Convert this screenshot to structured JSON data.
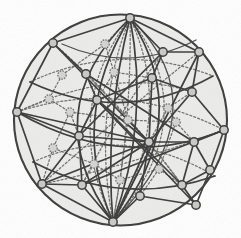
{
  "figure": {
    "background_color": "#ffffff",
    "sphere_fill_color": "#ececea",
    "sphere_outline_color": "#3b3b3b",
    "front_edge_color": "#3a3a3a",
    "back_edge_color": "#6e6e6e",
    "node_fill_color": "#c9c9c6",
    "node_stroke_color": "#383838",
    "node_radius": 4.2,
    "sphere": {
      "cx": 120.5,
      "cy": 120,
      "rx": 107,
      "ry": 106
    },
    "counts": {
      "nodes": 32,
      "front_edges": 46,
      "back_edges": 34
    }
  },
  "chart_data": {
    "type": "scatter",
    "xlabel": "",
    "ylabel": "",
    "xlim": [
      0,
      241
    ],
    "ylim": [
      0,
      238
    ],
    "grid": false,
    "legend": "none",
    "nodes": [
      {
        "id": 0,
        "x": 130,
        "y": 18,
        "layer": "front",
        "label": "top-pole"
      },
      {
        "id": 1,
        "x": 53,
        "y": 43,
        "layer": "front",
        "label": "upper-left"
      },
      {
        "id": 2,
        "x": 105,
        "y": 44,
        "layer": "back",
        "label": "upper-mid-back"
      },
      {
        "id": 3,
        "x": 163,
        "y": 52,
        "layer": "front",
        "label": "upper-right"
      },
      {
        "id": 4,
        "x": 199,
        "y": 52,
        "layer": "front",
        "label": "upper-far-right"
      },
      {
        "id": 5,
        "x": 62,
        "y": 75,
        "layer": "back",
        "label": "left-upper-back"
      },
      {
        "id": 6,
        "x": 86,
        "y": 74,
        "layer": "front",
        "label": "left-upper"
      },
      {
        "id": 7,
        "x": 152,
        "y": 78,
        "layer": "front",
        "label": "mid-upper-right"
      },
      {
        "id": 8,
        "x": 192,
        "y": 92,
        "layer": "front",
        "label": "right-upper"
      },
      {
        "id": 9,
        "x": 49,
        "y": 99,
        "layer": "back",
        "label": "left-back"
      },
      {
        "id": 10,
        "x": 97,
        "y": 100,
        "layer": "front",
        "label": "center-upper-left"
      },
      {
        "id": 11,
        "x": 17,
        "y": 112,
        "layer": "front",
        "label": "left-pole"
      },
      {
        "id": 12,
        "x": 168,
        "y": 108,
        "layer": "back",
        "label": "right-mid-back"
      },
      {
        "id": 13,
        "x": 79,
        "y": 136,
        "layer": "front",
        "label": "center-left"
      },
      {
        "id": 14,
        "x": 149,
        "y": 142,
        "layer": "front",
        "label": "center-hub"
      },
      {
        "id": 15,
        "x": 224,
        "y": 130,
        "layer": "front",
        "label": "right-pole"
      },
      {
        "id": 16,
        "x": 53,
        "y": 148,
        "layer": "back",
        "label": "lower-left-back"
      },
      {
        "id": 17,
        "x": 194,
        "y": 142,
        "layer": "front",
        "label": "right-lower"
      },
      {
        "id": 18,
        "x": 94,
        "y": 164,
        "layer": "back",
        "label": "lower-mid-back"
      },
      {
        "id": 19,
        "x": 159,
        "y": 169,
        "layer": "back",
        "label": "lower-right-back"
      },
      {
        "id": 20,
        "x": 42,
        "y": 184,
        "layer": "front",
        "label": "lower-left"
      },
      {
        "id": 21,
        "x": 82,
        "y": 185,
        "layer": "front",
        "label": "lower-left-mid"
      },
      {
        "id": 22,
        "x": 140,
        "y": 196,
        "layer": "front",
        "label": "lower-mid"
      },
      {
        "id": 23,
        "x": 182,
        "y": 185,
        "layer": "front",
        "label": "lower-right"
      },
      {
        "id": 24,
        "x": 113,
        "y": 222,
        "layer": "front",
        "label": "bottom-pole"
      },
      {
        "id": 25,
        "x": 196,
        "y": 205,
        "layer": "front",
        "label": "lower-far-right"
      },
      {
        "id": 26,
        "x": 128,
        "y": 120,
        "layer": "back",
        "label": "inner-center-back"
      },
      {
        "id": 27,
        "x": 114,
        "y": 72,
        "layer": "back",
        "label": "inner-upper-back"
      },
      {
        "id": 28,
        "x": 176,
        "y": 122,
        "layer": "back",
        "label": "inner-right-back"
      },
      {
        "id": 29,
        "x": 70,
        "y": 112,
        "layer": "back",
        "label": "inner-left-back"
      },
      {
        "id": 30,
        "x": 120,
        "y": 180,
        "layer": "back",
        "label": "inner-lower-back"
      },
      {
        "id": 31,
        "x": 210,
        "y": 170,
        "layer": "front",
        "label": "right-lower-edge"
      }
    ]
  }
}
